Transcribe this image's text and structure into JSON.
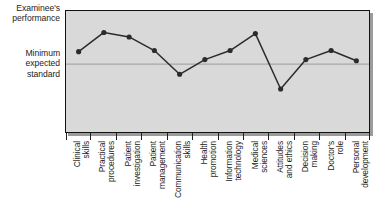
{
  "chart_data": {
    "type": "line",
    "title": "",
    "subtitle": "",
    "xlabel": "",
    "ylabel": "Examinee's performance",
    "categories": [
      "Clinical\nskills",
      "Practical\nprocedures",
      "Patient\ninvestigation",
      "Patient\nmanagement",
      "Communication\nskills",
      "Health\npromotion",
      "Information\ntechnology",
      "Medical\nsciences",
      "Attitudes\nand ethics",
      "Decision\nmaking",
      "Doctor's\nrole",
      "Personal\ndevelopment"
    ],
    "series": [
      {
        "name": "Examinee's performance",
        "values": [
          1.1,
          2.8,
          2.4,
          1.2,
          -0.9,
          0.4,
          1.2,
          2.7,
          -2.2,
          0.4,
          1.2,
          0.3
        ]
      }
    ],
    "y_axis": {
      "labels": [
        {
          "text": "Examinee's\nperformance",
          "position": "top"
        },
        {
          "text": "Minimum\nexpected\nstandard",
          "position": "threshold"
        }
      ],
      "ticks_visible": false,
      "range_note": "unlabelled ordinal scale"
    },
    "reference_line": {
      "label": "Minimum expected standard",
      "value": 0,
      "color": "#9a9a9a",
      "style": "solid"
    },
    "grid": false,
    "legend": {
      "visible": false,
      "position": "none"
    },
    "style": {
      "plot_background": "#d9d9d9",
      "border_color": "#121212",
      "line_color": "#2b2b2b",
      "marker_color": "#2b2b2b",
      "marker_shape": "circle",
      "text_color": "#1d1d1d"
    }
  },
  "labels": {
    "top_axis": "Examinee's\nperformance",
    "threshold_axis": "Minimum\nexpected\nstandard"
  }
}
